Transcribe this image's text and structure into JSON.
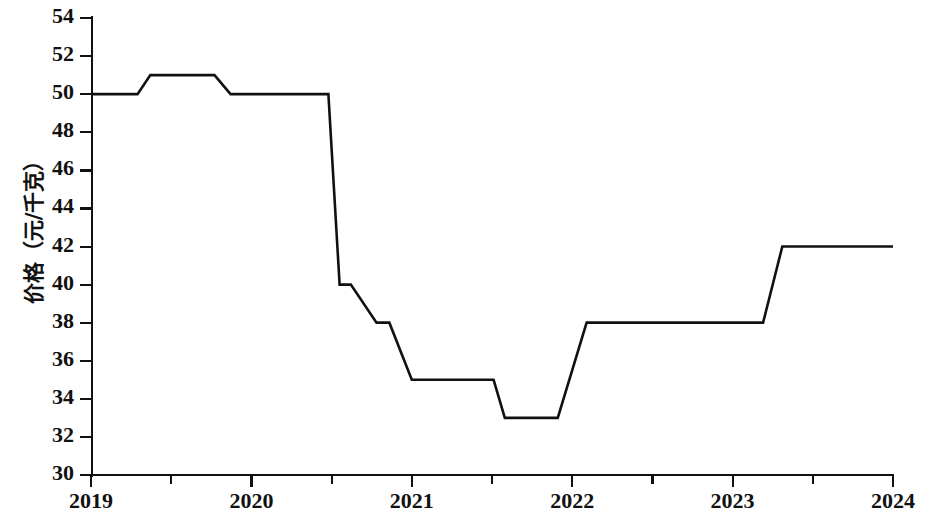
{
  "chart_data": {
    "type": "line",
    "title": "",
    "xlabel": "",
    "ylabel": "价格（元/千克）",
    "xlim": [
      2019,
      2024
    ],
    "ylim": [
      30,
      54
    ],
    "grid": false,
    "legend": null,
    "x_tick_labels": [
      "2019",
      "2020",
      "2021",
      "2022",
      "2023",
      "2024"
    ],
    "x_tick_values": [
      2019,
      2020,
      2021,
      2022,
      2023,
      2024
    ],
    "x_minor_tick_values": [
      2019.5,
      2020.5,
      2021.5,
      2022.5,
      2023.5
    ],
    "y_tick_labels": [
      "30",
      "32",
      "34",
      "36",
      "38",
      "40",
      "42",
      "44",
      "46",
      "48",
      "50",
      "52",
      "54"
    ],
    "y_tick_values": [
      30,
      32,
      34,
      36,
      38,
      40,
      42,
      44,
      46,
      48,
      50,
      52,
      54
    ],
    "series": [
      {
        "name": "价格",
        "color": "#111111",
        "line_width": 2.6,
        "points": [
          [
            2019.0,
            50
          ],
          [
            2019.29,
            50
          ],
          [
            2019.37,
            51
          ],
          [
            2019.77,
            51
          ],
          [
            2019.87,
            50
          ],
          [
            2020.47,
            50
          ],
          [
            2020.48,
            50
          ],
          [
            2020.55,
            40
          ],
          [
            2020.62,
            40
          ],
          [
            2020.78,
            38
          ],
          [
            2020.86,
            38
          ],
          [
            2021.0,
            35
          ],
          [
            2021.51,
            35
          ],
          [
            2021.58,
            33
          ],
          [
            2021.91,
            33
          ],
          [
            2022.09,
            38
          ],
          [
            2023.19,
            38
          ],
          [
            2023.31,
            42
          ],
          [
            2024.0,
            42
          ]
        ]
      }
    ]
  }
}
